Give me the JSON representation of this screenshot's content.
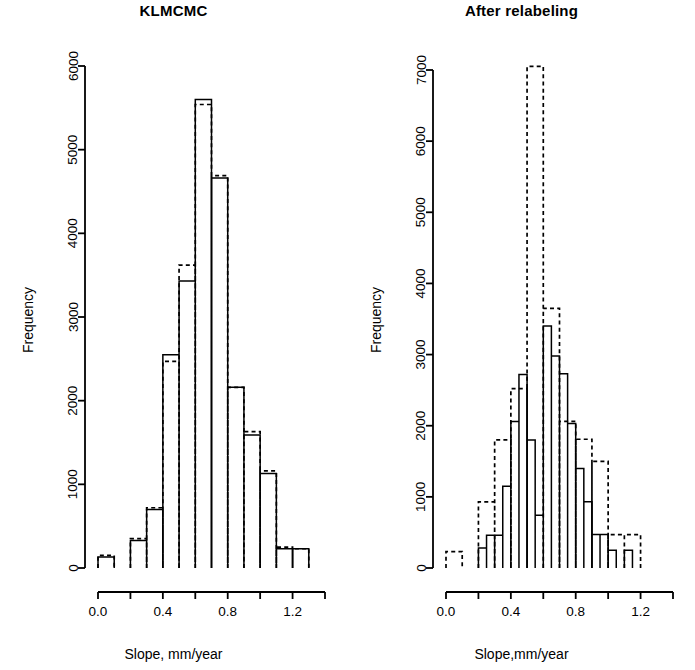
{
  "figure": {
    "width": 695,
    "height": 670,
    "background": "#ffffff",
    "ink": "#000000"
  },
  "panels": [
    {
      "id": "klmcmc",
      "title": "KLMCMC",
      "xlabel": "Slope, mm/year",
      "ylabel": "Frequency"
    },
    {
      "id": "after-relabeling",
      "title": "After relabeling",
      "xlabel": "Slope,mm/year",
      "ylabel": "Frequency"
    }
  ],
  "chart_data": [
    {
      "type": "bar",
      "id": "klmcmc",
      "title": "KLMCMC",
      "xlabel": "Slope, mm/year",
      "ylabel": "Frequency",
      "grid": false,
      "legend": "none",
      "xlim": [
        0.0,
        1.4
      ],
      "ylim": [
        0,
        6000
      ],
      "xticks": [
        0.0,
        0.2,
        0.4,
        0.6,
        0.8,
        1.0,
        1.2,
        1.4
      ],
      "xticklabels": [
        "0.0",
        "",
        "0.4",
        "",
        "0.8",
        "",
        "1.2",
        ""
      ],
      "yticks": [
        0,
        1000,
        2000,
        3000,
        4000,
        5000,
        6000
      ],
      "yticklabels": [
        "0",
        "1000",
        "2000",
        "3000",
        "4000",
        "5000",
        "6000"
      ],
      "bin_width": 0.1,
      "series": [
        {
          "name": "solid",
          "style": "solid",
          "bin_edges": [
            0.0,
            0.1,
            0.2,
            0.3,
            0.4,
            0.5,
            0.6,
            0.7,
            0.8,
            0.9,
            1.0,
            1.1,
            1.2,
            1.3
          ],
          "values": [
            130,
            0,
            330,
            700,
            2550,
            3430,
            5600,
            4660,
            2160,
            1590,
            1130,
            230,
            230
          ]
        },
        {
          "name": "dashed",
          "style": "dashed",
          "bin_edges": [
            0.0,
            0.1,
            0.2,
            0.3,
            0.4,
            0.5,
            0.6,
            0.7,
            0.8,
            0.9,
            1.0,
            1.1,
            1.2,
            1.3
          ],
          "values": [
            150,
            0,
            350,
            720,
            2470,
            3620,
            5540,
            4690,
            2160,
            1630,
            1160,
            250,
            230
          ]
        }
      ]
    },
    {
      "type": "bar",
      "id": "after-relabeling",
      "title": "After relabeling",
      "xlabel": "Slope,mm/year",
      "ylabel": "Frequency",
      "grid": false,
      "legend": "none",
      "xlim": [
        0.0,
        1.4
      ],
      "ylim": [
        0,
        7000
      ],
      "xticks": [
        0.0,
        0.2,
        0.4,
        0.6,
        0.8,
        1.0,
        1.2,
        1.4
      ],
      "xticklabels": [
        "0.0",
        "",
        "0.4",
        "",
        "0.8",
        "",
        "1.2",
        ""
      ],
      "yticks": [
        0,
        1000,
        2000,
        3000,
        4000,
        5000,
        6000,
        7000
      ],
      "yticklabels": [
        "0",
        "1000",
        "2000",
        "3000",
        "4000",
        "5000",
        "6000",
        "7000"
      ],
      "series": [
        {
          "name": "solid",
          "style": "solid",
          "bin_width": 0.05,
          "bin_edges": [
            0.2,
            0.25,
            0.3,
            0.35,
            0.4,
            0.45,
            0.5,
            0.55,
            0.6,
            0.65,
            0.7,
            0.75,
            0.8,
            0.85,
            0.9,
            0.95,
            1.0,
            1.05,
            1.1,
            1.15,
            1.2,
            1.25
          ],
          "values": [
            280,
            460,
            460,
            1150,
            2060,
            2720,
            1800,
            740,
            3400,
            2980,
            2730,
            2030,
            1400,
            930,
            470,
            470,
            250,
            0,
            250,
            0,
            0
          ]
        },
        {
          "name": "dashed",
          "style": "dashed",
          "bin_width": 0.1,
          "bin_edges": [
            0.0,
            0.1,
            0.2,
            0.3,
            0.4,
            0.5,
            0.6,
            0.7,
            0.8,
            0.9,
            1.0,
            1.1,
            1.2,
            1.3
          ],
          "values": [
            230,
            0,
            930,
            1800,
            2520,
            7050,
            3650,
            2060,
            1810,
            1500,
            470,
            470,
            0
          ]
        }
      ]
    }
  ]
}
